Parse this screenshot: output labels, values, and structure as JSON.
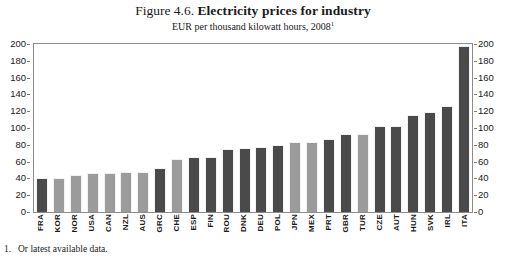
{
  "figure": {
    "title_prefix": "Figure 4.6.",
    "title_main": "Electricity prices for industry",
    "subtitle": "EUR per thousand kilowatt hours, 2008",
    "subtitle_footnote_marker": "1",
    "footnote_number": "1.",
    "footnote_text": "Or latest available data."
  },
  "chart_data": {
    "type": "bar",
    "title": "Figure 4.6. Electricity prices for industry",
    "subtitle": "EUR per thousand kilowatt hours, 2008",
    "xlabel": "",
    "ylabel": "",
    "ylim": [
      0,
      200
    ],
    "yticks": [
      0,
      20,
      40,
      60,
      80,
      100,
      120,
      140,
      160,
      180,
      200
    ],
    "ytick_labels": [
      "0",
      "20",
      "40",
      "60",
      "80",
      "100",
      "120",
      "140",
      "160",
      "180",
      "200"
    ],
    "grid": false,
    "legend": "none",
    "axis_mirrored": true,
    "categories": [
      "FRA",
      "KOR",
      "NOR",
      "USA",
      "CAN",
      "NZL",
      "AUS",
      "GRC",
      "CHE",
      "ESP",
      "FIN",
      "ROU",
      "DNK",
      "DEU",
      "POL",
      "JPN",
      "MEX",
      "PRT",
      "GBR",
      "TUR",
      "CZE",
      "AUT",
      "HUN",
      "SVK",
      "IRL",
      "ITA"
    ],
    "values": [
      40,
      41,
      44,
      46,
      46,
      48,
      48,
      53,
      63,
      65,
      66,
      75,
      76,
      78,
      80,
      83,
      83,
      87,
      93,
      93,
      102,
      103,
      116,
      119,
      126,
      198
    ],
    "bar_shades": [
      "dark",
      "light",
      "light",
      "light",
      "light",
      "light",
      "light",
      "dark",
      "light",
      "dark",
      "dark",
      "dark",
      "dark",
      "dark",
      "dark",
      "light",
      "light",
      "dark",
      "dark",
      "light",
      "dark",
      "dark",
      "dark",
      "dark",
      "dark",
      "dark"
    ],
    "colors": {
      "bar_dark": "#4a4a4a",
      "bar_light": "#9b9b9b",
      "axis": "#8c8c8c",
      "text": "#1a1a1a",
      "background": "#ffffff"
    }
  }
}
